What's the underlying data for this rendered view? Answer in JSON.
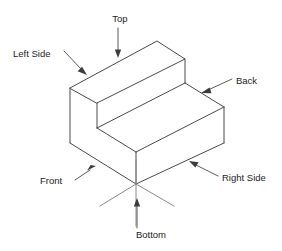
{
  "diagram": {
    "background_color": "#ffffff",
    "edge_color": "#4a4a4a",
    "hidden_edge_color": "#8a8a8a",
    "leader_color": "#5a5a5a",
    "text_color": "#1d1d1d",
    "labels": {
      "top": "Top",
      "left_side": "Left Side",
      "back": "Back",
      "right_side": "Right Side",
      "front": "Front",
      "bottom": "Bottom"
    }
  }
}
